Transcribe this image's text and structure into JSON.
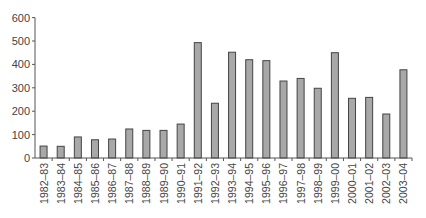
{
  "chart_data": {
    "type": "bar",
    "title": "",
    "xlabel": "",
    "ylabel": "",
    "ylim": [
      0,
      600
    ],
    "yticks": [
      0,
      100,
      200,
      300,
      400,
      500,
      600
    ],
    "grid": false,
    "legend": null,
    "categories": [
      "1982–83",
      "1983–84",
      "1984–85",
      "1985–86",
      "1986–87",
      "1987–88",
      "1988–89",
      "1989–90",
      "1990–91",
      "1991–92",
      "1992–93",
      "1993–94",
      "1994–95",
      "1995–96",
      "1996–97",
      "1997–98",
      "1998–99",
      "1999–00",
      "2000–01",
      "2001–02",
      "2002–03",
      "2003–04"
    ],
    "values": [
      51,
      50,
      90,
      78,
      81,
      124,
      118,
      118,
      145,
      493,
      234,
      452,
      420,
      416,
      329,
      340,
      298,
      450,
      255,
      259,
      188,
      377
    ],
    "colors": {
      "bar_fill": "#a8a8a8",
      "bar_stroke": "#444444",
      "axis": "#555555"
    }
  }
}
